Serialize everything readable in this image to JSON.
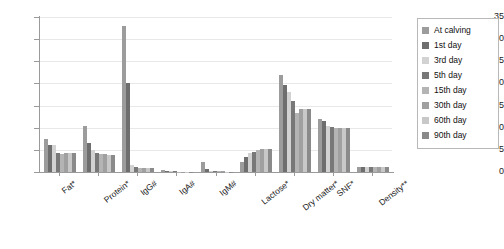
{
  "chart_data": {
    "type": "bar",
    "title": "",
    "xlabel": "",
    "ylabel": "",
    "ylim": [
      0,
      35
    ],
    "yticks": [
      0,
      5,
      10,
      15,
      20,
      25,
      30,
      35
    ],
    "grid": true,
    "legend_position": "right",
    "categories": [
      "Fat*",
      "Protein*",
      "IgG#",
      "IgA#",
      "IgM#",
      "Lactose*",
      "Dry matter*",
      "SNF*",
      "Density**"
    ],
    "series": [
      {
        "name": "At calving",
        "color": "#9c9c9c",
        "values": [
          7.5,
          10.5,
          33.0,
          0.42,
          2.2,
          2.2,
          22.0,
          12.0,
          1.03
        ]
      },
      {
        "name": "1st day",
        "color": "#6e6e6e",
        "values": [
          6.0,
          6.6,
          20.2,
          0.3,
          0.7,
          3.4,
          19.7,
          11.5,
          1.03
        ]
      },
      {
        "name": "3rd day",
        "color": "#d2d2d2",
        "values": [
          6.0,
          5.0,
          1.6,
          0.18,
          0.3,
          4.2,
          18.0,
          10.5,
          1.03
        ]
      },
      {
        "name": "5th day",
        "color": "#787878",
        "values": [
          4.2,
          4.4,
          1.2,
          0.12,
          0.2,
          4.6,
          16.0,
          10.2,
          1.03
        ]
      },
      {
        "name": "15th day",
        "color": "#b4b4b4",
        "values": [
          4.0,
          4.0,
          1.0,
          0.1,
          0.15,
          4.9,
          13.3,
          10.0,
          1.03
        ]
      },
      {
        "name": "30th day",
        "color": "#a0a0a0",
        "values": [
          4.3,
          4.0,
          1.0,
          0.1,
          0.12,
          5.1,
          14.3,
          10.0,
          1.03
        ]
      },
      {
        "name": "60th day",
        "color": "#c8c8c8",
        "values": [
          4.3,
          3.9,
          1.0,
          0.1,
          0.1,
          5.2,
          14.3,
          10.0,
          1.03
        ]
      },
      {
        "name": "90th day",
        "color": "#8a8a8a",
        "values": [
          4.3,
          3.9,
          1.0,
          0.1,
          0.1,
          5.3,
          14.3,
          10.0,
          1.03
        ]
      }
    ]
  }
}
